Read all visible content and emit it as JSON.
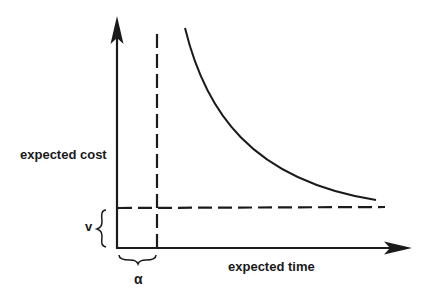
{
  "diagram": {
    "y_axis_label": "expected cost",
    "x_axis_label": "expected time",
    "v_label": "v",
    "alpha_label": "α",
    "colors": {
      "line": "#1a1a1a",
      "background": "#ffffff"
    },
    "elements": [
      {
        "name": "y-axis",
        "type": "arrow",
        "from": [
          117,
          248
        ],
        "to": [
          117,
          16
        ]
      },
      {
        "name": "x-axis",
        "type": "arrow",
        "from": [
          117,
          248
        ],
        "to": [
          412,
          248
        ]
      },
      {
        "name": "alpha-threshold",
        "type": "dashed-vertical",
        "x": 157,
        "y_range": [
          34,
          248
        ]
      },
      {
        "name": "v-threshold",
        "type": "dashed-horizontal",
        "y": 208,
        "x_range": [
          117,
          385
        ]
      },
      {
        "name": "tradeoff-curve",
        "type": "decreasing-convex-curve",
        "from": [
          185,
          28
        ],
        "to": [
          376,
          200
        ]
      }
    ]
  }
}
